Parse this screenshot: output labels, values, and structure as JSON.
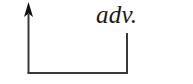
{
  "figure": {
    "background_color": "#ffffff",
    "stroke_color": "#3a3a3a",
    "arrow_fill_color": "#111111",
    "label": {
      "text": "adv.",
      "style": "italic-serif",
      "color": "#1a1a1a"
    },
    "geometry": {
      "vertical_axis": {
        "x": 28.5,
        "y_top": 14,
        "y_bottom": 73,
        "stroke_width": 2
      },
      "arrow_head": {
        "tip_x": 28.5,
        "tip_y": 2,
        "left_x": 24,
        "right_x": 33,
        "base_y": 17
      },
      "baseline": {
        "x_start": 28,
        "x_end": 128,
        "y": 73,
        "stroke_width": 2
      },
      "right_riser": {
        "x": 127,
        "y_top": 33,
        "y_bottom": 73,
        "stroke_width": 2
      }
    }
  }
}
